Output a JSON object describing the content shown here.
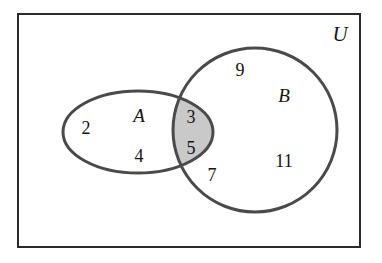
{
  "figure": {
    "type": "venn-diagram",
    "background_color": "#ffffff",
    "width": 382,
    "height": 263
  },
  "universe": {
    "label": "U",
    "label_x": 340,
    "label_y": 36,
    "rect": {
      "x": 18,
      "y": 14,
      "width": 342,
      "height": 233
    },
    "border_color": "#2b2b2b",
    "border_width": 2,
    "fill_color": "#ffffff"
  },
  "sets": [
    {
      "id": "A",
      "label": "A",
      "shape": "ellipse",
      "cx": 138,
      "cy": 132,
      "rx": 75,
      "ry": 41,
      "label_x": 139,
      "label_y": 118,
      "stroke_color": "#4a4a4a",
      "stroke_width": 3,
      "fill_color": "none"
    },
    {
      "id": "B",
      "label": "B",
      "shape": "circle",
      "cx": 255,
      "cy": 130,
      "r": 82,
      "label_x": 284,
      "label_y": 98,
      "stroke_color": "#4a4a4a",
      "stroke_width": 3,
      "fill_color": "none"
    }
  ],
  "intersection": {
    "id": "A-and-B",
    "shaded": true,
    "fill_color": "#c9c9c9",
    "description": "A intersect B"
  },
  "elements": [
    {
      "value": "2",
      "x": 86,
      "y": 130,
      "region": "A-only"
    },
    {
      "value": "4",
      "x": 139,
      "y": 158,
      "region": "A-only"
    },
    {
      "value": "3",
      "x": 191,
      "y": 119,
      "region": "A-and-B"
    },
    {
      "value": "5",
      "x": 191,
      "y": 150,
      "region": "A-and-B"
    },
    {
      "value": "7",
      "x": 212,
      "y": 177,
      "region": "B-only"
    },
    {
      "value": "9",
      "x": 240,
      "y": 72,
      "region": "B-only"
    },
    {
      "value": "11",
      "x": 284,
      "y": 163,
      "region": "B-only"
    }
  ]
}
